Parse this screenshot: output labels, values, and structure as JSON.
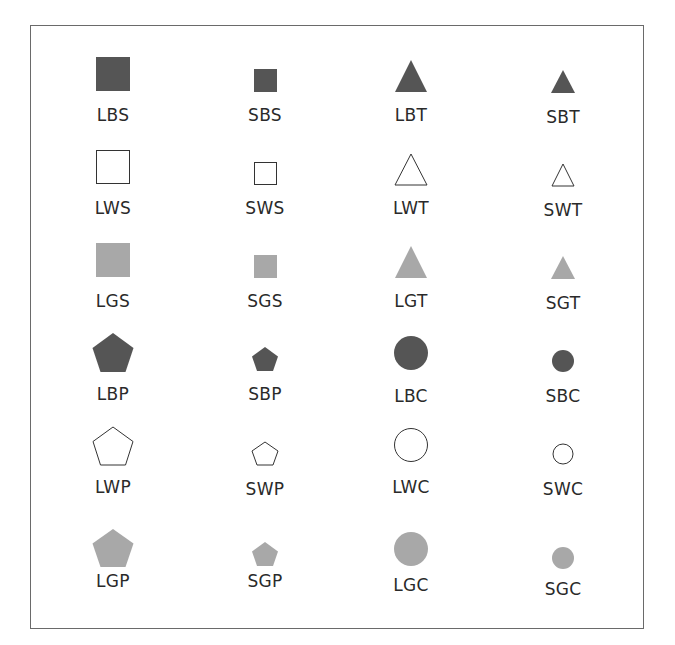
{
  "colors": {
    "black_fill": "#555555",
    "gray_fill": "#a8a8a8",
    "white_fill": "#ffffff",
    "stroke": "#333333",
    "frame": "#6a6a6a"
  },
  "legend": {
    "size_codes": {
      "L": "large",
      "S": "small"
    },
    "color_codes": {
      "B": "black",
      "W": "white",
      "G": "gray"
    },
    "shape_codes": {
      "S": "square",
      "T": "triangle",
      "P": "pentagon",
      "C": "circle"
    }
  },
  "rows": [
    [
      {
        "label": "LBS",
        "size": "L",
        "color": "B",
        "shape": "S"
      },
      {
        "label": "SBS",
        "size": "S",
        "color": "B",
        "shape": "S"
      },
      {
        "label": "LBT",
        "size": "L",
        "color": "B",
        "shape": "T"
      },
      {
        "label": "SBT",
        "size": "S",
        "color": "B",
        "shape": "T"
      }
    ],
    [
      {
        "label": "LWS",
        "size": "L",
        "color": "W",
        "shape": "S"
      },
      {
        "label": "SWS",
        "size": "S",
        "color": "W",
        "shape": "S"
      },
      {
        "label": "LWT",
        "size": "L",
        "color": "W",
        "shape": "T"
      },
      {
        "label": "SWT",
        "size": "S",
        "color": "W",
        "shape": "T"
      }
    ],
    [
      {
        "label": "LGS",
        "size": "L",
        "color": "G",
        "shape": "S"
      },
      {
        "label": "SGS",
        "size": "S",
        "color": "G",
        "shape": "S"
      },
      {
        "label": "LGT",
        "size": "L",
        "color": "G",
        "shape": "T"
      },
      {
        "label": "SGT",
        "size": "S",
        "color": "G",
        "shape": "T"
      }
    ],
    [
      {
        "label": "LBP",
        "size": "L",
        "color": "B",
        "shape": "P"
      },
      {
        "label": "SBP",
        "size": "S",
        "color": "B",
        "shape": "P"
      },
      {
        "label": "LBC",
        "size": "L",
        "color": "B",
        "shape": "C"
      },
      {
        "label": "SBC",
        "size": "S",
        "color": "B",
        "shape": "C"
      }
    ],
    [
      {
        "label": "LWP",
        "size": "L",
        "color": "W",
        "shape": "P"
      },
      {
        "label": "SWP",
        "size": "S",
        "color": "W",
        "shape": "P"
      },
      {
        "label": "LWC",
        "size": "L",
        "color": "W",
        "shape": "C"
      },
      {
        "label": "SWC",
        "size": "S",
        "color": "W",
        "shape": "C"
      }
    ],
    [
      {
        "label": "LGP",
        "size": "L",
        "color": "G",
        "shape": "P"
      },
      {
        "label": "SGP",
        "size": "S",
        "color": "G",
        "shape": "P"
      },
      {
        "label": "LGC",
        "size": "L",
        "color": "G",
        "shape": "C"
      },
      {
        "label": "SGC",
        "size": "S",
        "color": "G",
        "shape": "C"
      }
    ]
  ]
}
